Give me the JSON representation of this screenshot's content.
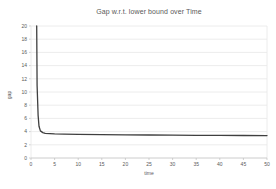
{
  "window": {
    "kind": "embedded-chart"
  },
  "colors": {
    "background": "#ffffff",
    "grid": "#e7e7e7",
    "axis": "#bfbfbf",
    "border": "#e7e7e7",
    "text": "#595959",
    "line": "#3f3f3f"
  },
  "chart_data": {
    "type": "line",
    "title": "Gap w.r.t. lower bound over Time",
    "xlabel": "time",
    "ylabel": "gap",
    "xlim": [
      0,
      50
    ],
    "ylim": [
      0,
      20
    ],
    "x_ticks": [
      0,
      5,
      10,
      15,
      20,
      25,
      30,
      35,
      40,
      45,
      50
    ],
    "y_ticks": [
      0,
      2,
      4,
      6,
      8,
      10,
      12,
      14,
      16,
      18,
      20
    ],
    "grid": "horizontal",
    "legend": "none",
    "series": [
      {
        "name": "gap",
        "x": [
          1.2,
          1.3,
          1.5,
          1.7,
          2.0,
          2.5,
          3,
          4,
          5,
          7,
          10,
          15,
          20,
          25,
          30,
          35,
          40,
          45,
          50
        ],
        "y": [
          20,
          11,
          6.5,
          4.8,
          4.1,
          3.85,
          3.75,
          3.7,
          3.65,
          3.62,
          3.58,
          3.54,
          3.5,
          3.48,
          3.46,
          3.44,
          3.42,
          3.41,
          3.4
        ]
      }
    ]
  }
}
